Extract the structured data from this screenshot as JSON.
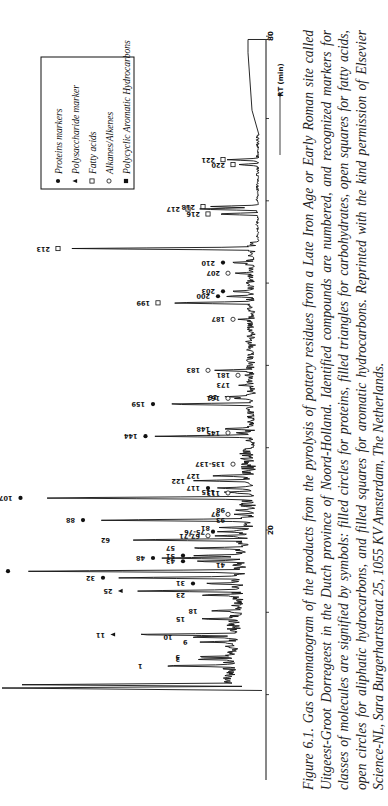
{
  "figure": {
    "number": "Figure 6.1.",
    "caption": "Gas chromatogram of the products from the pyrolysis of pottery residues from a Late Iron Age or Early Roman site called Uitgeest-Groot Dorregeest in the Dutch province of Noord-Holland. Identified compounds are numbered, and recognized markers for classes of molecules are signified by symbols: filled circles for proteins, filled triangles for carbohydrates, open squares for fatty acids, open circles for aliphatic hydrocarbons, and filled squares for aromatic hydrocarbons. Reprinted with the kind permission of Elsevier Science-NL, Sara Burgerhartstraat 25, 1055 KV Amsterdam, The Netherlands."
  },
  "legend": {
    "items": [
      {
        "symbol": "filled-circle",
        "label": "Proteins markers"
      },
      {
        "symbol": "filled-triangle",
        "label": "Polysaccharide marker"
      },
      {
        "symbol": "open-square",
        "label": "Fatty acids"
      },
      {
        "symbol": "open-circle",
        "label": "Alkanes/Alkenes"
      },
      {
        "symbol": "filled-square",
        "label": "Polycyclic Aromatic Hydrocarbons"
      }
    ]
  },
  "axis": {
    "xlabel": "RT (min)",
    "tick_labels": [
      "20",
      "80"
    ]
  },
  "chart_data": {
    "type": "line",
    "xlabel": "RT (min)",
    "ylabel": "Relative intensity",
    "xlim": [
      0,
      80
    ],
    "orientation": "rotated 90 degrees (retention time increases upward on page)",
    "legend": [
      "Proteins markers",
      "Polysaccharide marker",
      "Fatty acids",
      "Alkanes/Alkenes",
      "Polycyclic Aromatic Hydrocarbons"
    ],
    "legend_position": "upper-left (rotated frame: top-right)",
    "grid": false,
    "peaks": [
      {
        "label": "1",
        "rt": 3.5,
        "height": 0.45,
        "marker": null
      },
      {
        "label": "2",
        "rt": 4.3,
        "height": 0.3,
        "marker": null
      },
      {
        "label": "3",
        "rt": 4.6,
        "height": 0.3,
        "marker": null
      },
      {
        "label": "9",
        "rt": 6.4,
        "height": 0.27,
        "marker": null
      },
      {
        "label": "10",
        "rt": 7.0,
        "height": 0.33,
        "marker": null
      },
      {
        "label": "11",
        "rt": 7.3,
        "height": 0.58,
        "marker": "filled-triangle"
      },
      {
        "label": "15",
        "rt": 9.2,
        "height": 0.28,
        "marker": null
      },
      {
        "label": "18",
        "rt": 10.2,
        "height": 0.23,
        "marker": null
      },
      {
        "label": "23",
        "rt": 12.1,
        "height": 0.28,
        "marker": null
      },
      {
        "label": "25",
        "rt": 12.6,
        "height": 0.55,
        "marker": "filled-triangle"
      },
      {
        "label": "31",
        "rt": 13.5,
        "height": 0.26,
        "marker": "filled-circle"
      },
      {
        "label": "32",
        "rt": 14.2,
        "height": 0.62,
        "marker": "filled-circle"
      },
      {
        "label": "35",
        "rt": 15.0,
        "height": 1.0,
        "marker": "filled-circle"
      },
      {
        "label": "41",
        "rt": 15.8,
        "height": 0.12,
        "marker": null
      },
      {
        "label": "43",
        "rt": 16.2,
        "height": 0.3,
        "marker": "filled-circle"
      },
      {
        "label": "48",
        "rt": 16.6,
        "height": 0.42,
        "marker": "filled-circle"
      },
      {
        "label": "51",
        "rt": 16.9,
        "height": 0.3,
        "marker": "filled-circle"
      },
      {
        "label": "57",
        "rt": 17.8,
        "height": 0.32,
        "marker": null
      },
      {
        "label": "62",
        "rt": 18.8,
        "height": 0.58,
        "marker": null
      },
      {
        "label": "67-71",
        "rt": 19.3,
        "height": 0.2,
        "marker": "open-circle"
      },
      {
        "label": "75-76",
        "rt": 19.8,
        "height": 0.18,
        "marker": "filled-circle"
      },
      {
        "label": "81",
        "rt": 20.3,
        "height": 0.18,
        "marker": null
      },
      {
        "label": "88",
        "rt": 21.2,
        "height": 0.7,
        "marker": "filled-circle"
      },
      {
        "label": "93",
        "rt": 21.2,
        "height": 0.12,
        "marker": null
      },
      {
        "label": "97",
        "rt": 21.9,
        "height": 0.12,
        "marker": "open-circle"
      },
      {
        "label": "98",
        "rt": 22.4,
        "height": 0.12,
        "marker": null
      },
      {
        "label": "107",
        "rt": 23.9,
        "height": 0.95,
        "marker": "filled-circle"
      },
      {
        "label": "113",
        "rt": 24.5,
        "height": 0.12,
        "marker": "open-circle"
      },
      {
        "label": "115",
        "rt": 24.6,
        "height": 0.16,
        "marker": null
      },
      {
        "label": "117",
        "rt": 25.1,
        "height": 0.2,
        "marker": "filled-circle"
      },
      {
        "label": "122",
        "rt": 26.0,
        "height": 0.28,
        "marker": null
      },
      {
        "label": "127",
        "rt": 26.6,
        "height": 0.22,
        "marker": null
      },
      {
        "label": "135-137",
        "rt": 28.0,
        "height": 0.1,
        "marker": "open-circle"
      },
      {
        "label": "144",
        "rt": 31.4,
        "height": 0.45,
        "marker": "filled-circle"
      },
      {
        "label": "145",
        "rt": 31.8,
        "height": 0.12,
        "marker": "open-circle"
      },
      {
        "label": "148",
        "rt": 32.3,
        "height": 0.18,
        "marker": null
      },
      {
        "label": "159",
        "rt": 35.3,
        "height": 0.42,
        "marker": "filled-circle"
      },
      {
        "label": "161",
        "rt": 36.0,
        "height": 0.12,
        "marker": "open-circle"
      },
      {
        "label": "16",
        "rt": 36.2,
        "height": 0.15,
        "marker": null
      },
      {
        "label": "173",
        "rt": 37.6,
        "height": 0.1,
        "marker": null
      },
      {
        "label": "181",
        "rt": 38.8,
        "height": 0.08,
        "marker": "open-circle"
      },
      {
        "label": "183",
        "rt": 39.4,
        "height": 0.2,
        "marker": "open-circle"
      },
      {
        "label": "187",
        "rt": 45.6,
        "height": 0.1,
        "marker": "open-circle"
      },
      {
        "label": "199",
        "rt": 47.6,
        "height": 0.4,
        "marker": "open-square"
      },
      {
        "label": "200",
        "rt": 48.4,
        "height": 0.16,
        "marker": "filled-circle"
      },
      {
        "label": "203",
        "rt": 49.0,
        "height": 0.14,
        "marker": "filled-circle"
      },
      {
        "label": "207",
        "rt": 51.2,
        "height": 0.12,
        "marker": "open-circle"
      },
      {
        "label": "210",
        "rt": 52.5,
        "height": 0.14,
        "marker": "filled-circle"
      },
      {
        "label": "213",
        "rt": 54.2,
        "height": 0.8,
        "marker": "open-square"
      },
      {
        "label": "216",
        "rt": 58.4,
        "height": 0.2,
        "marker": "open-square"
      },
      {
        "label": "217",
        "rt": 59.0,
        "height": 0.28,
        "marker": "open-square"
      },
      {
        "label": "218",
        "rt": 59.3,
        "height": 0.22,
        "marker": "open-square"
      },
      {
        "label": "220",
        "rt": 64.4,
        "height": 0.1,
        "marker": "open-square"
      },
      {
        "label": "221",
        "rt": 65.0,
        "height": 0.14,
        "marker": "open-square"
      }
    ]
  }
}
